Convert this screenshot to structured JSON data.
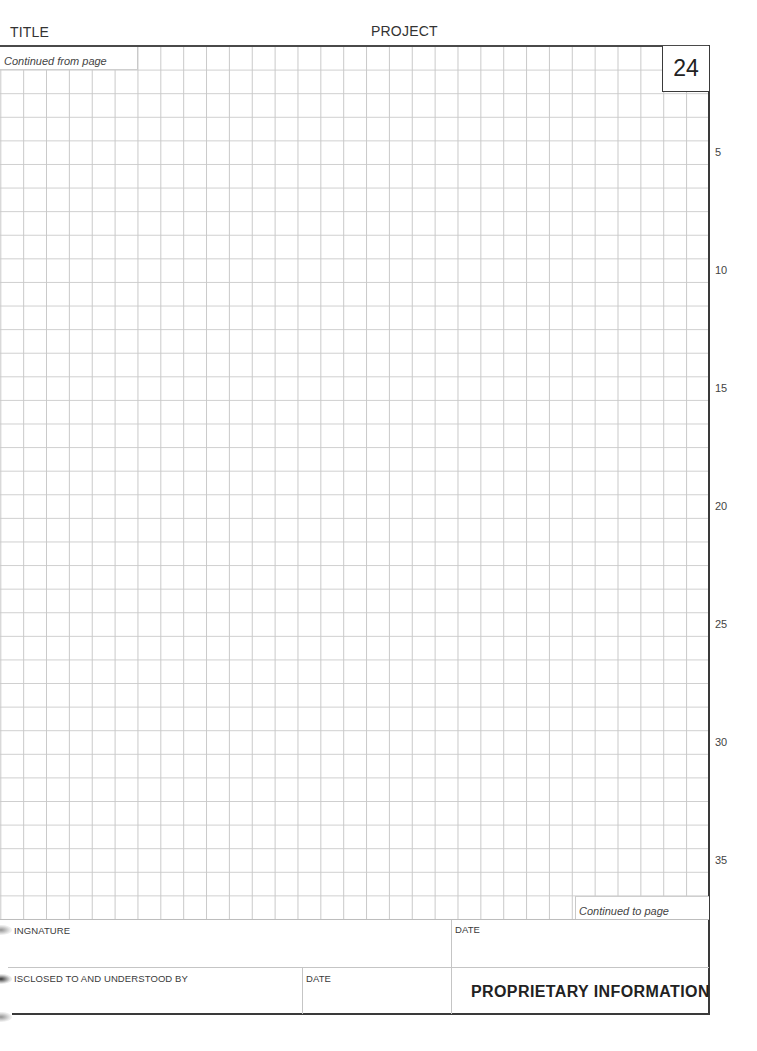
{
  "header": {
    "title_label": "TITLE",
    "project_label": "PROJECT"
  },
  "page": {
    "number": "24",
    "continued_from_label": "Continued from page",
    "continued_to_label": "Continued to page"
  },
  "grid": {
    "rows": 37,
    "columns": 31,
    "line_numbers": [
      "5",
      "10",
      "15",
      "20",
      "25",
      "30",
      "35"
    ]
  },
  "footer": {
    "signature_label": "INGNATURE",
    "signature_date_label": "DATE",
    "disclosed_label": "ISCLOSED TO AND UNDERSTOOD BY",
    "disclosed_date_label": "DATE",
    "proprietary_label": "PROPRIETARY INFORMATION"
  },
  "colors": {
    "grid_line": "#c9c9c9",
    "border": "#3a3a3a",
    "text": "#2a2a2a"
  }
}
